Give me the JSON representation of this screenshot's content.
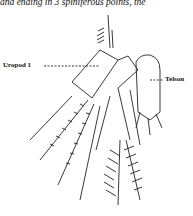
{
  "page": {
    "top_text": "and ending in 3 spiniferous points, the"
  },
  "figure": {
    "labels": {
      "uropod": "Uropod 1",
      "telson": "Telson"
    }
  }
}
